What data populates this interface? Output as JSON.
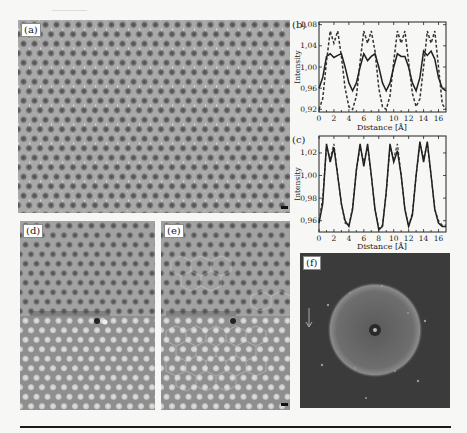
{
  "figure": {
    "panels": {
      "a": {
        "label": "(a)",
        "description": "HRTEM image of hexagonal lattice"
      },
      "b": {
        "label": "(b)"
      },
      "c": {
        "label": "(c)"
      },
      "d": {
        "label": "(d)",
        "description": "HRTEM image with line defect"
      },
      "e": {
        "label": "(e)",
        "description": "HRTEM image with overlaid hexagonal model"
      },
      "f": {
        "label": "(f)",
        "description": "Fourier transform (FFT) pattern"
      }
    }
  },
  "chart_data": [
    {
      "type": "line",
      "panel": "(b)",
      "title": "",
      "xlabel": "Distance [Å]",
      "ylabel": "Intensity",
      "xlim": [
        0,
        17
      ],
      "ylim": [
        0.915,
        1.085
      ],
      "xticks": [
        "0",
        "2",
        "4",
        "6",
        "8",
        "10",
        "12",
        "14",
        "16"
      ],
      "yticks": [
        "0,92",
        "0,96",
        "1,00",
        "1,04",
        "1,08"
      ],
      "grid": false,
      "x": [
        0,
        0.5,
        1,
        1.5,
        2,
        2.5,
        3,
        3.5,
        4,
        4.5,
        5,
        5.5,
        6,
        6.5,
        7,
        7.5,
        8,
        8.5,
        9,
        9.5,
        10,
        10.5,
        11,
        11.5,
        12,
        12.5,
        13,
        13.5,
        14,
        14.5,
        15,
        15.5,
        16,
        16.5,
        17
      ],
      "series": [
        {
          "name": "solid",
          "style": "solid",
          "values": [
            0.96,
            0.98,
            1.02,
            1.025,
            1.018,
            1.022,
            1.025,
            1.0,
            0.97,
            0.955,
            0.97,
            1.0,
            1.025,
            1.012,
            1.02,
            1.025,
            1.0,
            0.97,
            0.955,
            0.97,
            1.0,
            1.025,
            1.02,
            1.02,
            1.0,
            0.97,
            0.955,
            0.98,
            1.03,
            1.022,
            1.03,
            1.015,
            0.98,
            0.96,
            0.955
          ]
        },
        {
          "name": "dashed",
          "style": "dashed",
          "values": [
            0.92,
            0.94,
            1.01,
            1.068,
            1.045,
            1.068,
            1.02,
            0.96,
            0.925,
            0.92,
            0.945,
            1.01,
            1.068,
            1.045,
            1.068,
            1.03,
            0.96,
            0.925,
            0.92,
            0.945,
            1.01,
            1.068,
            1.045,
            1.068,
            1.01,
            0.95,
            0.925,
            0.94,
            1.0,
            1.068,
            1.045,
            1.068,
            1.0,
            0.93,
            0.92
          ]
        }
      ]
    },
    {
      "type": "line",
      "panel": "(c)",
      "title": "",
      "xlabel": "Distance [Å]",
      "ylabel": "Intensity",
      "xlim": [
        0,
        17
      ],
      "ylim": [
        0.95,
        1.035
      ],
      "xticks": [
        "0",
        "2",
        "4",
        "6",
        "8",
        "10",
        "12",
        "14",
        "16"
      ],
      "yticks": [
        "0,96",
        "0,98",
        "1,00",
        "1,02"
      ],
      "grid": false,
      "x": [
        0,
        0.5,
        1,
        1.5,
        2,
        2.5,
        3,
        3.5,
        4,
        4.5,
        5,
        5.5,
        6,
        6.5,
        7,
        7.5,
        8,
        8.5,
        9,
        9.5,
        10,
        10.5,
        11,
        11.5,
        12,
        12.5,
        13,
        13.5,
        14,
        14.5,
        15,
        15.5,
        16,
        16.5,
        17
      ],
      "series": [
        {
          "name": "solid",
          "style": "solid",
          "values": [
            0.958,
            0.975,
            1.028,
            1.012,
            1.025,
            1.0,
            0.975,
            0.96,
            0.955,
            0.97,
            1.005,
            1.028,
            1.008,
            1.028,
            1.0,
            0.97,
            0.952,
            0.955,
            0.985,
            1.028,
            1.012,
            1.022,
            1.0,
            0.97,
            0.955,
            0.965,
            1.0,
            1.03,
            1.012,
            1.03,
            1.0,
            0.97,
            0.958,
            0.955,
            0.955
          ]
        },
        {
          "name": "dashed",
          "style": "dashed",
          "values": [
            0.96,
            0.98,
            1.025,
            1.015,
            1.028,
            1.0,
            0.975,
            0.958,
            0.956,
            0.972,
            1.005,
            1.025,
            1.012,
            1.025,
            1.0,
            0.97,
            0.953,
            0.956,
            0.985,
            1.025,
            1.015,
            1.028,
            1.0,
            0.97,
            0.955,
            0.967,
            1.0,
            1.028,
            1.015,
            1.028,
            1.0,
            0.97,
            0.96,
            0.956,
            0.956
          ]
        }
      ]
    }
  ]
}
